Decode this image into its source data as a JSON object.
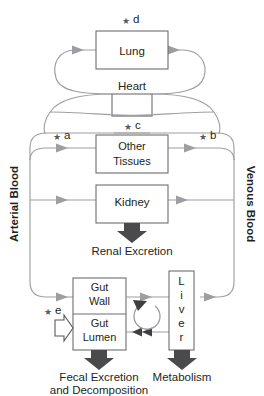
{
  "figure": {
    "type": "flow-diagram",
    "background_color": "#ffffff",
    "line_color": "#9c9ea1",
    "box_stroke_color": "#6d6e71",
    "text_color": "#231f20",
    "block_arrow_color": "#4a4a4c"
  },
  "compartments": [
    {
      "id": "lung",
      "label": "Lung"
    },
    {
      "id": "heart",
      "label": "Heart"
    },
    {
      "id": "other_tissues",
      "label_line1": "Other",
      "label_line2": "Tissues"
    },
    {
      "id": "kidney",
      "label": "Kidney"
    },
    {
      "id": "gut_wall",
      "label_line1": "Gut",
      "label_line2": "Wall"
    },
    {
      "id": "gut_lumen",
      "label_line1": "Gut",
      "label_line2": "Lumen"
    },
    {
      "id": "liver",
      "label": "Liver",
      "letters": [
        "L",
        "i",
        "v",
        "e",
        "r"
      ],
      "orientation": "vertical"
    }
  ],
  "rails": {
    "left": {
      "id": "arterial-blood",
      "label": "Arterial Blood",
      "direction": "bottom-to-top-text"
    },
    "right": {
      "id": "venous-blood",
      "label": "Venous Blood",
      "direction": "top-to-bottom-text"
    }
  },
  "outputs": [
    {
      "id": "renal-excretion",
      "label": "Renal Excretion",
      "source": "kidney"
    },
    {
      "id": "fecal-excretion",
      "label_line1": "Fecal Excretion",
      "label_line2": "and Decomposition",
      "source": "gut_lumen"
    },
    {
      "id": "metabolism",
      "label": "Metabolism",
      "source": "liver"
    }
  ],
  "inputs": [
    {
      "id": "oral-dose",
      "marker": "e",
      "target": "gut_lumen",
      "style": "hollow-arrow"
    }
  ],
  "star_markers": [
    {
      "id": "star-a",
      "glyph": "★",
      "label": "a",
      "near": "arterial-blood-to-other-tissues"
    },
    {
      "id": "star-b",
      "glyph": "★",
      "label": "b",
      "near": "other-tissues-to-venous-blood"
    },
    {
      "id": "star-c",
      "glyph": "★",
      "label": "c",
      "near": "other-tissues"
    },
    {
      "id": "star-d",
      "glyph": "★",
      "label": "d",
      "near": "lung"
    },
    {
      "id": "star-e",
      "glyph": "★",
      "label": "e",
      "near": "gut-lumen-input"
    }
  ],
  "recycle": {
    "id": "enterohepatic-recirculation",
    "shape": "circular-arrow"
  }
}
